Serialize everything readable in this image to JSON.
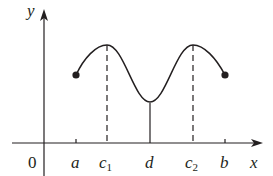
{
  "figure": {
    "axes": {
      "x_label": "x",
      "y_label": "y",
      "origin_label": "0"
    },
    "ticks": [
      {
        "id": "a",
        "label": "a",
        "sub": "",
        "x": 76,
        "dashed": false
      },
      {
        "id": "c1",
        "label": "c",
        "sub": "1",
        "x": 107,
        "dashed": true
      },
      {
        "id": "d",
        "label": "d",
        "sub": "",
        "x": 150,
        "dashed": false
      },
      {
        "id": "c2",
        "label": "c",
        "sub": "2",
        "x": 193,
        "dashed": true
      },
      {
        "id": "b",
        "label": "b",
        "sub": "",
        "x": 225,
        "dashed": false
      }
    ],
    "curve": {
      "description": "Continuous function on closed interval [a,b] with local maxima at c1 and c2 and local minimum at d; closed endpoints at a and b",
      "endpoints": [
        "a",
        "b"
      ],
      "local_maxima": [
        "c1",
        "c2"
      ],
      "local_minimum": [
        "d"
      ]
    },
    "colors": {
      "ink": "#231f20",
      "background": "#ffffff"
    }
  }
}
